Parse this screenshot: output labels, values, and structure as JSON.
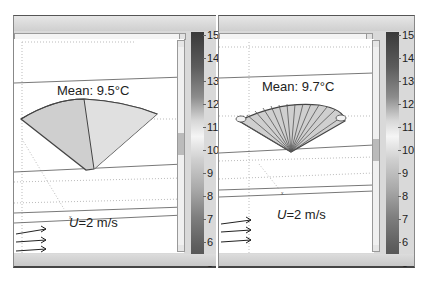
{
  "panels": [
    {
      "id": "left",
      "mean_label": "Mean: 9.5°C",
      "velocity": {
        "symbol": "U",
        "rest": "=2 m/s"
      },
      "shape": "cone-2-segments"
    },
    {
      "id": "right",
      "mean_label": "Mean: 9.7°C",
      "velocity": {
        "symbol": "U",
        "rest": "=2 m/s"
      },
      "shape": "fan-many-segments"
    }
  ],
  "colorbar": {
    "unit": "°C",
    "min": 5,
    "max": 15,
    "ticks": [
      "15",
      "14",
      "13",
      "12",
      "11",
      "10",
      "9",
      "8",
      "7",
      "6",
      "5"
    ]
  },
  "icons": {
    "wind_arrows": "arrow-right-icon",
    "scroll_button": "scroll-arrow-icon"
  }
}
